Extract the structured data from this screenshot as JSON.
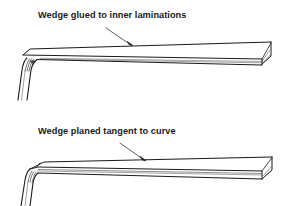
{
  "figures": [
    {
      "id": "top",
      "label": "Wedge glued to inner laminations",
      "subject": "wedge",
      "description": "Wedge glued to inner laminations of bent laminated board"
    },
    {
      "id": "bottom",
      "label": "Wedge planed tangent to curve",
      "subject": "wedge",
      "description": "Wedge planed tangent to curve of bent laminated board"
    }
  ],
  "colors": {
    "line": "#1a1a1a",
    "background": "#ffffff"
  }
}
